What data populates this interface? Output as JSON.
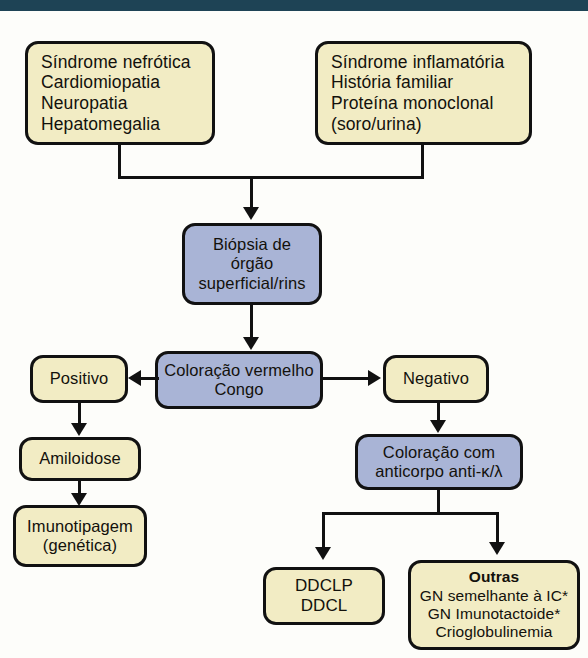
{
  "page": {
    "language": "pt-BR",
    "header_bar_color": "#1e4355",
    "background_color": "#fdfdfa"
  },
  "palette": {
    "node_yellow": "#f2ecc4",
    "node_blue": "#a9b4d6",
    "node_border": "#111111",
    "connector": "#111111",
    "text": "#13110c"
  },
  "nodes": {
    "clinical_left": {
      "name": "clinical-features-left",
      "color": "#f2ecc4",
      "lines": [
        "Síndrome nefrótica",
        "Cardiomiopatia",
        "Neuropatia",
        "Hepatomegalia"
      ]
    },
    "clinical_right": {
      "name": "clinical-features-right",
      "color": "#f2ecc4",
      "lines": [
        "Síndrome inflamatória",
        "História familiar",
        "Proteína monoclonal",
        "(soro/urina)"
      ]
    },
    "biopsy": {
      "name": "biopsy-step",
      "color": "#a9b4d6",
      "lines": [
        "Biópsia de",
        "órgão",
        "superficial/rins"
      ]
    },
    "congo_red": {
      "name": "congo-red-stain",
      "color": "#a9b4d6",
      "lines": [
        "Coloração vermelho",
        "Congo"
      ]
    },
    "positive": {
      "name": "result-positive",
      "color": "#f2ecc4",
      "lines": [
        "Positivo"
      ]
    },
    "negative": {
      "name": "result-negative",
      "color": "#f2ecc4",
      "lines": [
        "Negativo"
      ]
    },
    "amyloidosis": {
      "name": "diagnosis-amyloidosis",
      "color": "#f2ecc4",
      "lines": [
        "Amiloidose"
      ]
    },
    "immunotyping": {
      "name": "immunotyping-step",
      "color": "#f2ecc4",
      "lines": [
        "Imunotipagem",
        "(genética)"
      ]
    },
    "antibody_stain": {
      "name": "antibody-stain-step",
      "color": "#a9b4d6",
      "lines": [
        "Coloração com",
        "anticorpo anti-κ/λ"
      ]
    },
    "ddclp": {
      "name": "diagnosis-ddclp",
      "color": "#f2ecc4",
      "lines": [
        "DDCLP",
        "DDCL"
      ]
    },
    "others": {
      "name": "diagnosis-others",
      "color": "#f2ecc4",
      "heading": "Outras",
      "lines": [
        "GN semelhante à IC*",
        "GN Imunotactoide*",
        "Crioglobulinemia"
      ]
    }
  },
  "edges": [
    {
      "name": "edge-clinical-left-to-biopsy",
      "from": "clinical_left",
      "to": "biopsy",
      "style": "elbow-merge"
    },
    {
      "name": "edge-clinical-right-to-biopsy",
      "from": "clinical_right",
      "to": "biopsy",
      "style": "elbow-merge"
    },
    {
      "name": "edge-biopsy-to-congo-red",
      "from": "biopsy",
      "to": "congo_red",
      "style": "straight-down"
    },
    {
      "name": "edge-congo-red-to-positive",
      "from": "congo_red",
      "to": "positive",
      "style": "arrow-left"
    },
    {
      "name": "edge-congo-red-to-negative",
      "from": "congo_red",
      "to": "negative",
      "style": "arrow-right"
    },
    {
      "name": "edge-positive-to-amyloidosis",
      "from": "positive",
      "to": "amyloidosis",
      "style": "straight-down"
    },
    {
      "name": "edge-amyloidosis-to-immunotyping",
      "from": "amyloidosis",
      "to": "immunotyping",
      "style": "straight-down"
    },
    {
      "name": "edge-negative-to-antibody-stain",
      "from": "negative",
      "to": "antibody_stain",
      "style": "straight-down"
    },
    {
      "name": "edge-antibody-stain-to-ddclp",
      "from": "antibody_stain",
      "to": "ddclp",
      "style": "elbow-split"
    },
    {
      "name": "edge-antibody-stain-to-others",
      "from": "antibody_stain",
      "to": "others",
      "style": "elbow-split"
    }
  ]
}
